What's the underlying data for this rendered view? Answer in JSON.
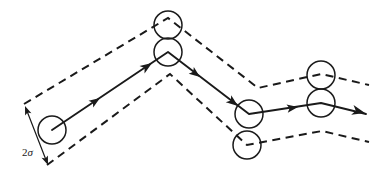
{
  "figure": {
    "background_color": "#ffffff",
    "ink_color": "#1a1a1a",
    "width": 370,
    "height": 177
  },
  "annotations": {
    "corridor_width_label": "2σ",
    "corridor_width_number": "2",
    "corridor_width_symbol": "σ"
  },
  "chart_data": {
    "type": "line",
    "xlabel": "",
    "ylabel": "",
    "xlim": [
      0,
      370
    ],
    "ylim": [
      177,
      0
    ],
    "grid": false,
    "legend": "none",
    "series": [
      {
        "name": "mean-path",
        "style": "solid-with-arrowheads",
        "points": [
          [
            52,
            130
          ],
          [
            168,
            52
          ],
          [
            249,
            114
          ],
          [
            321,
            103
          ],
          [
            366,
            114
          ]
        ]
      },
      {
        "name": "upper-bound",
        "style": "dashed",
        "points": [
          [
            24,
            104
          ],
          [
            168,
            18
          ],
          [
            258,
            88
          ],
          [
            321,
            74
          ],
          [
            369,
            85
          ]
        ]
      },
      {
        "name": "lower-bound",
        "style": "dashed",
        "points": [
          [
            47,
            165
          ],
          [
            170,
            74
          ],
          [
            247,
            145
          ],
          [
            322,
            131
          ],
          [
            369,
            142
          ]
        ]
      }
    ],
    "nodes": [
      {
        "name": "start-disk",
        "cx": 52,
        "cy": 130,
        "r": 14
      },
      {
        "name": "peak-upper-bound-disk",
        "cx": 168,
        "cy": 25,
        "r": 14
      },
      {
        "name": "peak-path-disk",
        "cx": 168,
        "cy": 52,
        "r": 14
      },
      {
        "name": "valley-path-disk",
        "cx": 249,
        "cy": 114,
        "r": 14
      },
      {
        "name": "valley-lower-bound-disk",
        "cx": 247,
        "cy": 145,
        "r": 14
      },
      {
        "name": "right-upper-bound-disk",
        "cx": 321,
        "cy": 75,
        "r": 14
      },
      {
        "name": "right-path-disk",
        "cx": 321,
        "cy": 103,
        "r": 14
      }
    ],
    "arrowheads": [
      {
        "name": "segment-1-mid-arrow",
        "x": 100,
        "y": 98,
        "angle_deg": -33.9
      },
      {
        "name": "segment-1-end-arrow",
        "x": 152,
        "y": 63,
        "angle_deg": -33.9
      },
      {
        "name": "segment-2-mid-arrow",
        "x": 200,
        "y": 77,
        "angle_deg": 37.4
      },
      {
        "name": "segment-2-end-arrow",
        "x": 238,
        "y": 106,
        "angle_deg": 37.4
      },
      {
        "name": "segment-3-mid-arrow",
        "x": 298,
        "y": 107,
        "angle_deg": -8.7
      },
      {
        "name": "segment-4-end-arrow",
        "x": 365,
        "y": 113,
        "angle_deg": 13.7
      }
    ],
    "dimension": {
      "name": "corridor-width-dimension",
      "label": "2σ",
      "from": [
        25,
        106
      ],
      "to": [
        48,
        165
      ],
      "double_headed": true,
      "label_position": [
        22,
        156
      ]
    }
  }
}
